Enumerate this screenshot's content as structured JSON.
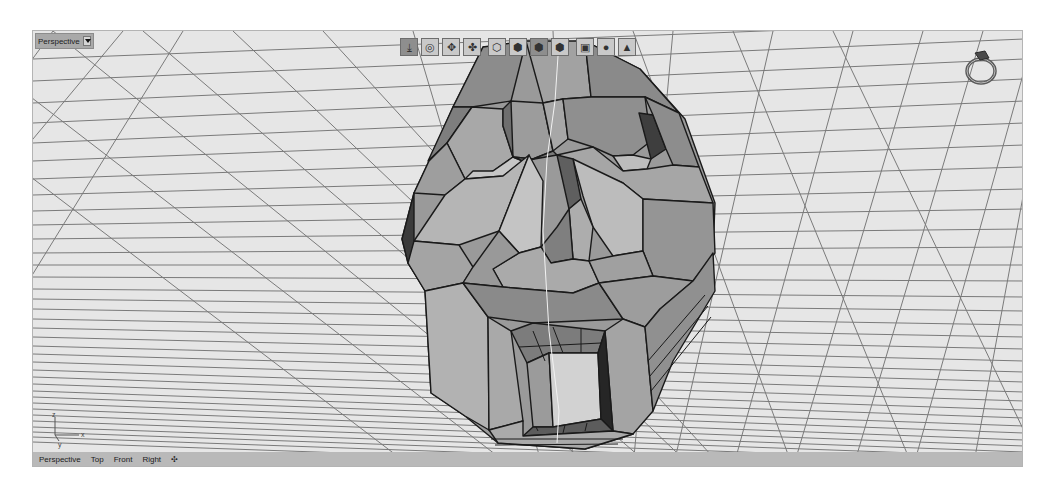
{
  "viewport": {
    "title": "Perspective",
    "colors": {
      "background": "#e6e6e6",
      "grid": "#7a7a7a",
      "mesh_light": "#b4b4b4",
      "mesh_mid": "#8f8f8f",
      "mesh_dark": "#4a4a4a",
      "edge": "#1a1a1a"
    }
  },
  "toolbar": {
    "buttons": [
      {
        "name": "rotate-view-icon",
        "glyph": "⤓"
      },
      {
        "name": "orbit-icon",
        "glyph": "◎"
      },
      {
        "name": "pan-icon",
        "glyph": "✥"
      },
      {
        "name": "zoom-icon",
        "glyph": "✤"
      },
      {
        "name": "wireframe-icon",
        "glyph": "⬡"
      },
      {
        "name": "shaded-icon",
        "glyph": "⬢"
      },
      {
        "name": "rendered-icon",
        "glyph": "⬢"
      },
      {
        "name": "ghosted-icon",
        "glyph": "⬢"
      },
      {
        "name": "xray-icon",
        "glyph": "▣"
      },
      {
        "name": "material-sphere-icon",
        "glyph": "●"
      },
      {
        "name": "drop-icon",
        "glyph": "▲"
      }
    ]
  },
  "axis": {
    "x": "x",
    "y": "y",
    "z": "z"
  },
  "tabs": {
    "items": [
      "Perspective",
      "Top",
      "Front",
      "Right"
    ],
    "add": "✣"
  }
}
